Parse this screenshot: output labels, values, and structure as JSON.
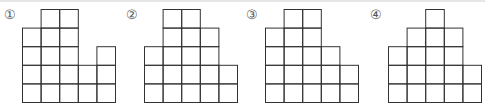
{
  "figures": [
    {
      "label": "①",
      "column_heights": [
        4,
        5,
        5,
        2,
        3
      ],
      "origin_x": 22,
      "label_x": 4
    },
    {
      "label": "②",
      "column_heights": [
        3,
        5,
        5,
        4,
        2
      ],
      "origin_x": 24,
      "label_x": 6
    },
    {
      "label": "③",
      "column_heights": [
        4,
        5,
        5,
        3,
        2
      ],
      "origin_x": 25,
      "label_x": 6
    },
    {
      "label": "④",
      "column_heights": [
        3,
        4,
        5,
        4,
        2
      ],
      "origin_x": 28,
      "label_x": 10
    }
  ],
  "grid": {
    "cell_size": 18.6,
    "baseline_y": 102,
    "line_color": "#333333"
  }
}
